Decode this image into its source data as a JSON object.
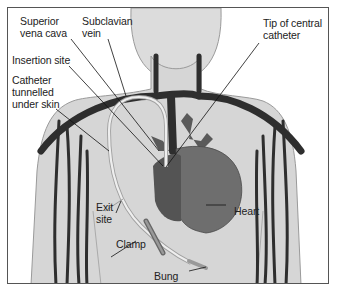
{
  "diagram": {
    "labels": {
      "superior_vena_cava": "Superior\nvena cava",
      "subclavian_vein": "Subclavian\nvein",
      "insertion_site": "Insertion site",
      "catheter_tunnelled": "Catheter\ntunnelled\nunder skin",
      "tip_of_catheter": "Tip of central\ncatheter",
      "exit_site": "Exit\nsite",
      "clamp": "Clamp",
      "heart": "Heart",
      "bung": "Bung"
    },
    "colors": {
      "skin": "#d6d6d6",
      "skin_outline": "#9a9a9a",
      "vein": "#2e2e2e",
      "heart_main": "#6e6e6e",
      "heart_right": "#545454",
      "catheter": "#eeeeee",
      "catheter_outline": "#a0a0a0",
      "leader_line": "#111111",
      "border": "#555555"
    }
  }
}
